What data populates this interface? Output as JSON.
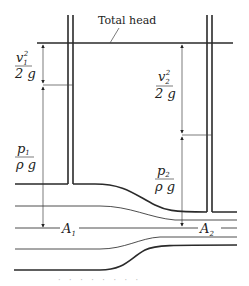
{
  "diagram": {
    "title_label": "Total head",
    "left_section": {
      "velocity_head": {
        "num": "v",
        "sub": "1",
        "sup": "2",
        "den": "2 g"
      },
      "pressure_head": {
        "num": "p",
        "sub": "1",
        "den": "ρ g"
      },
      "area_label": {
        "main": "A",
        "sub": "1"
      }
    },
    "right_section": {
      "velocity_head": {
        "num": "v",
        "sub": "2",
        "sup": "2",
        "den": "2 g"
      },
      "pressure_head": {
        "num": "p",
        "sub": "2",
        "den": "ρ g"
      },
      "area_label": {
        "main": "A",
        "sub": "2"
      }
    },
    "footer_dots": "· · · · · · · ·"
  }
}
